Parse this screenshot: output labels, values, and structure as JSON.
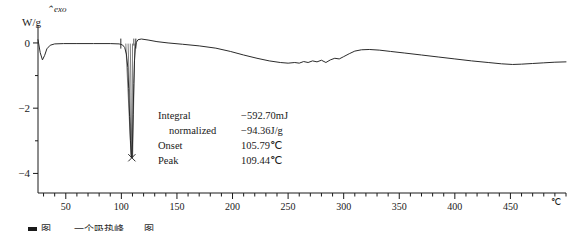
{
  "chart_data": {
    "type": "line",
    "title": "",
    "subtitle": "",
    "xlabel": "",
    "ylabel": "W/g",
    "x_unit": "℃",
    "y_unit": "W/g",
    "direction_label": "⌃exo",
    "xlim": [
      25,
      500
    ],
    "ylim": [
      -4.6,
      0.55
    ],
    "grid": false,
    "legend_position": "none",
    "xticks": [
      50,
      100,
      150,
      200,
      250,
      300,
      350,
      400,
      450
    ],
    "xtick_labels": [
      "50",
      "100",
      "150",
      "200",
      "250",
      "300",
      "350",
      "400",
      "450"
    ],
    "xminor_step": 10,
    "yticks": [
      0,
      -2,
      -4
    ],
    "ytick_labels": [
      "0",
      "−2",
      "−4"
    ],
    "yminor_step": 1,
    "series": [
      {
        "name": "DSC heat flow",
        "points": [
          [
            25,
            0.1
          ],
          [
            27,
            -0.3
          ],
          [
            29,
            -0.52
          ],
          [
            31,
            -0.38
          ],
          [
            33,
            -0.18
          ],
          [
            36,
            -0.07
          ],
          [
            40,
            -0.03
          ],
          [
            48,
            -0.02
          ],
          [
            60,
            -0.02
          ],
          [
            75,
            -0.02
          ],
          [
            90,
            -0.02
          ],
          [
            98,
            -0.03
          ],
          [
            101,
            -0.06
          ],
          [
            103,
            -0.14
          ],
          [
            104.5,
            -0.34
          ],
          [
            105.8,
            -0.75
          ],
          [
            106.6,
            -1.4
          ],
          [
            107.4,
            -2.25
          ],
          [
            108.2,
            -3.0
          ],
          [
            108.9,
            -3.42
          ],
          [
            109.44,
            -3.52
          ],
          [
            110.0,
            -3.1
          ],
          [
            110.6,
            -2.2
          ],
          [
            111.2,
            -1.25
          ],
          [
            111.8,
            -0.55
          ],
          [
            112.5,
            -0.18
          ],
          [
            113.5,
            0.02
          ],
          [
            115,
            0.1
          ],
          [
            118,
            0.12
          ],
          [
            124,
            0.09
          ],
          [
            132,
            0.04
          ],
          [
            142,
            0.0
          ],
          [
            155,
            -0.04
          ],
          [
            170,
            -0.09
          ],
          [
            185,
            -0.16
          ],
          [
            198,
            -0.26
          ],
          [
            210,
            -0.37
          ],
          [
            222,
            -0.47
          ],
          [
            233,
            -0.55
          ],
          [
            243,
            -0.6
          ],
          [
            250,
            -0.62
          ],
          [
            256,
            -0.6
          ],
          [
            260,
            -0.62
          ],
          [
            264,
            -0.57
          ],
          [
            268,
            -0.6
          ],
          [
            272,
            -0.55
          ],
          [
            276,
            -0.58
          ],
          [
            280,
            -0.53
          ],
          [
            284,
            -0.6
          ],
          [
            288,
            -0.52
          ],
          [
            292,
            -0.47
          ],
          [
            296,
            -0.49
          ],
          [
            300,
            -0.42
          ],
          [
            305,
            -0.33
          ],
          [
            310,
            -0.25
          ],
          [
            316,
            -0.21
          ],
          [
            323,
            -0.2
          ],
          [
            332,
            -0.22
          ],
          [
            342,
            -0.26
          ],
          [
            355,
            -0.31
          ],
          [
            370,
            -0.37
          ],
          [
            385,
            -0.43
          ],
          [
            400,
            -0.49
          ],
          [
            415,
            -0.55
          ],
          [
            430,
            -0.6
          ],
          [
            442,
            -0.64
          ],
          [
            452,
            -0.66
          ],
          [
            460,
            -0.65
          ],
          [
            470,
            -0.63
          ],
          [
            480,
            -0.61
          ],
          [
            490,
            -0.59
          ],
          [
            500,
            -0.58
          ]
        ]
      }
    ],
    "integration": {
      "onset_marker_x": 105.79,
      "peak_marker_x": 109.44,
      "peak_marker_y": -3.52,
      "baseline_y": -0.02,
      "left_limit_x": 99.5,
      "right_limit_x": 113.0,
      "marker_symbol": "×"
    }
  },
  "annotation": {
    "rows": [
      {
        "label": "Integral",
        "indent": false,
        "value": "−592.70mJ"
      },
      {
        "label": "normalized",
        "indent": true,
        "value": "−94.36J/g"
      },
      {
        "label": "Onset",
        "indent": false,
        "value": "105.79℃"
      },
      {
        "label": "Peak",
        "indent": false,
        "value": "109.44℃"
      }
    ]
  },
  "caption": {
    "text": "图……  一个吸热峰……图"
  },
  "colors": {
    "curve": "#2b2b2b",
    "axis": "#1a1a1a",
    "text": "#1a1a1a",
    "background": "#ffffff"
  }
}
